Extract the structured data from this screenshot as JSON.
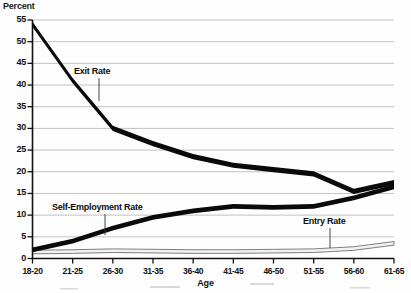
{
  "chart_data": {
    "type": "line",
    "title": "",
    "xlabel": "Age",
    "ylabel": "Percent",
    "ylim": [
      0,
      55
    ],
    "ytick_step": 5,
    "yticks": [
      0,
      5,
      10,
      15,
      20,
      25,
      30,
      35,
      40,
      45,
      50,
      55
    ],
    "grid": true,
    "legend_position": "inline-annotations",
    "categories": [
      "18-20",
      "21-25",
      "26-30",
      "31-35",
      "36-40",
      "41-45",
      "46-50",
      "51-55",
      "56-60",
      "61-65"
    ],
    "series": [
      {
        "name": "Exit Rate",
        "values": [
          54.0,
          41.0,
          30.0,
          26.5,
          23.5,
          21.5,
          20.5,
          19.5,
          15.5,
          17.5
        ],
        "style": "thick-black-band"
      },
      {
        "name": "Self-Employment Rate",
        "values": [
          2.0,
          4.0,
          7.0,
          9.5,
          11.0,
          12.0,
          11.8,
          12.0,
          14.0,
          16.5
        ],
        "style": "thick-black-band"
      },
      {
        "name": "Entry Rate",
        "values": [
          1.5,
          1.6,
          1.8,
          1.7,
          1.6,
          1.6,
          1.7,
          1.8,
          2.3,
          3.5
        ],
        "style": "thin-outlined-white-band"
      }
    ],
    "annotations": [
      {
        "text": "Exit Rate",
        "series": "Exit Rate",
        "leader": true
      },
      {
        "text": "Self-Employment Rate",
        "series": "Self-Employment Rate",
        "leader": true
      },
      {
        "text": "Entry Rate",
        "series": "Entry Rate",
        "leader": true
      }
    ],
    "colors": {
      "series_dark": "#0a0a0a",
      "series_light_fill": "#f2f2f2",
      "series_light_stroke": "#4a4a4a",
      "gridline": "#9a9a9a",
      "axis": "#111111",
      "background": "#fefefe"
    }
  }
}
